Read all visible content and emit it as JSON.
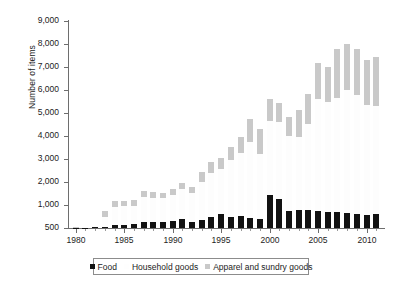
{
  "chart_data": {
    "type": "bar",
    "subtype": "stacked-bar",
    "title": "",
    "xlabel": "",
    "ylabel": "Number of items",
    "ylim": [
      500,
      9000
    ],
    "y_axis_broken_at_bottom": true,
    "ytick_labels": [
      "9,000",
      "8,000",
      "7,000",
      "6,000",
      "5,000",
      "4,000",
      "3,000",
      "2,000",
      "1,000",
      "500"
    ],
    "ytick_values": [
      9000,
      8000,
      7000,
      6000,
      5000,
      4000,
      3000,
      2000,
      1000,
      500
    ],
    "xtick_labels": [
      "1980",
      "1985",
      "1990",
      "1995",
      "2000",
      "2005",
      "2010"
    ],
    "xtick_values": [
      1980,
      1985,
      1990,
      1995,
      2000,
      2005,
      2010
    ],
    "grid": false,
    "legend_position": "bottom",
    "categories": [
      1980,
      1981,
      1982,
      1983,
      1984,
      1985,
      1986,
      1987,
      1988,
      1989,
      1990,
      1991,
      1992,
      1993,
      1994,
      1995,
      1996,
      1997,
      1998,
      1999,
      2000,
      2001,
      2002,
      2003,
      2004,
      2005,
      2006,
      2007,
      2008,
      2009,
      2010,
      2011
    ],
    "series": [
      {
        "name": "Food",
        "color": "#121212",
        "values": [
          505,
          510,
          515,
          530,
          560,
          570,
          590,
          640,
          635,
          640,
          660,
          690,
          640,
          670,
          740,
          800,
          745,
          760,
          710,
          700,
          1450,
          1270,
          880,
          900,
          890,
          860,
          850,
          840,
          830,
          800,
          790,
          800
        ]
      },
      {
        "name": "Household goods",
        "color": "#fdfdfd",
        "values": [
          5,
          8,
          20,
          210,
          390,
          400,
          390,
          710,
          685,
          680,
          790,
          990,
          880,
          1330,
          1660,
          1760,
          2200,
          2520,
          3030,
          2500,
          3200,
          3330,
          3110,
          3060,
          3620,
          4750,
          4650,
          4830,
          5150,
          5000,
          4560,
          4520
        ]
      },
      {
        "name": "Apparel and sundry goods",
        "color": "#c9c9c9",
        "values": [
          8,
          10,
          18,
          130,
          210,
          210,
          230,
          250,
          230,
          220,
          250,
          270,
          250,
          430,
          490,
          490,
          570,
          660,
          1010,
          1110,
          950,
          850,
          840,
          1150,
          1330,
          1550,
          1500,
          2110,
          2000,
          2000,
          1960,
          2130
        ]
      }
    ],
    "stacked_totals": [
      518,
      528,
      553,
      870,
      1160,
      1180,
      1210,
      1600,
      1550,
      1540,
      1700,
      1950,
      1770,
      2430,
      2890,
      3050,
      3515,
      3940,
      4750,
      4310,
      5600,
      5450,
      4830,
      5110,
      5840,
      7160,
      7000,
      7780,
      7980,
      7800,
      7310,
      7450
    ],
    "legend": [
      {
        "label": "Food",
        "swatch": "#121212"
      },
      {
        "label": "Household goods",
        "swatch": "#fefefe"
      },
      {
        "label": "Apparel and sundry goods",
        "swatch": "#c9c9c9"
      }
    ]
  }
}
